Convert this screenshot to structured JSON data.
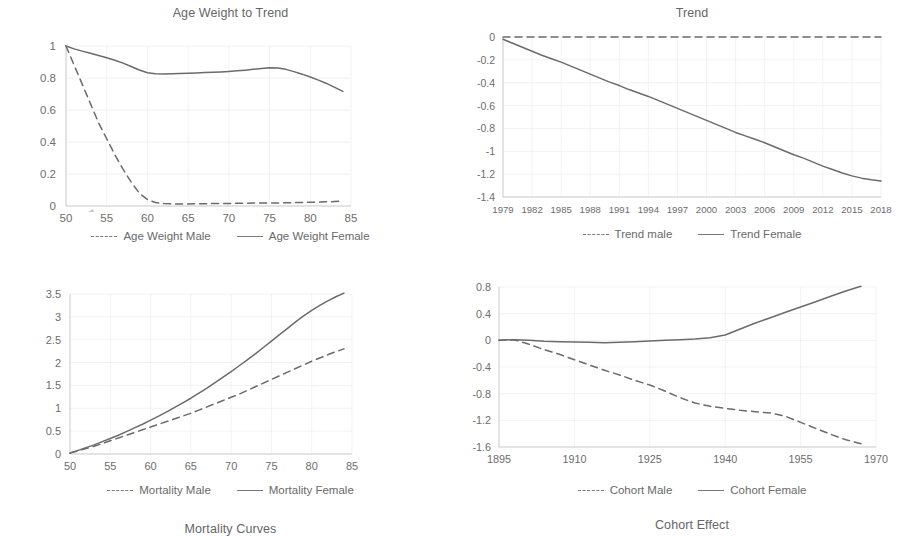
{
  "figure": {
    "background": "#ffffff",
    "line_color": "#6b6b6b",
    "grid_color": "#ededed",
    "text_color": "#6d6d6d"
  },
  "panels": [
    {
      "key": "age_weight",
      "legend": {
        "male_label": "Age Weight Male",
        "female_label": "Age Weight Female"
      }
    },
    {
      "key": "trend",
      "legend": {
        "male_label": "Trend male",
        "female_label": "Trend Female"
      }
    },
    {
      "key": "mortality",
      "legend": {
        "male_label": "Mortality Male",
        "female_label": "Mortality Female"
      }
    },
    {
      "key": "cohort",
      "legend": {
        "male_label": "Cohort Male",
        "female_label": "Cohort Female"
      }
    }
  ],
  "chart_data": [
    {
      "key": "age_weight",
      "type": "line",
      "title": "Age Weight to Trend",
      "xlabel": "",
      "ylabel": "",
      "xlim": [
        50,
        85
      ],
      "ylim": [
        0,
        1
      ],
      "xticks": [
        50,
        55,
        60,
        65,
        70,
        75,
        80,
        85
      ],
      "yticks": [
        0,
        0.2,
        0.4,
        0.6,
        0.8,
        1
      ],
      "ytick_labels": [
        "0",
        "0.2",
        "0.4",
        "0.6",
        "0.8",
        "1"
      ],
      "xtick_labels": [
        "50",
        "55",
        "60",
        "65",
        "70",
        "75",
        "80",
        "85"
      ],
      "grid": true,
      "legend_position": "bottom",
      "x": [
        50,
        51,
        52,
        53,
        54,
        55,
        56,
        57,
        58,
        59,
        60,
        61,
        62,
        63,
        64,
        65,
        66,
        67,
        68,
        69,
        70,
        71,
        72,
        73,
        74,
        75,
        76,
        77,
        78,
        79,
        80,
        81,
        82,
        83,
        84
      ],
      "series": [
        {
          "name": "Age Weight Male",
          "style": "dashed",
          "values": [
            1.0,
            0.88,
            0.76,
            0.64,
            0.52,
            0.42,
            0.32,
            0.23,
            0.15,
            0.08,
            0.04,
            0.022,
            0.015,
            0.013,
            0.013,
            0.013,
            0.014,
            0.014,
            0.015,
            0.015,
            0.016,
            0.017,
            0.017,
            0.018,
            0.018,
            0.019,
            0.019,
            0.02,
            0.021,
            0.022,
            0.023,
            0.024,
            0.026,
            0.028,
            0.03
          ]
        },
        {
          "name": "Age Weight Female",
          "style": "solid",
          "values": [
            1.0,
            0.982,
            0.968,
            0.955,
            0.941,
            0.927,
            0.911,
            0.893,
            0.872,
            0.85,
            0.833,
            0.826,
            0.825,
            0.826,
            0.828,
            0.83,
            0.832,
            0.834,
            0.836,
            0.838,
            0.841,
            0.845,
            0.849,
            0.854,
            0.859,
            0.864,
            0.862,
            0.854,
            0.84,
            0.824,
            0.806,
            0.787,
            0.766,
            0.741,
            0.716
          ]
        }
      ]
    },
    {
      "key": "trend",
      "type": "line",
      "title": "Trend",
      "xlabel": "",
      "ylabel": "",
      "xlim": [
        1979,
        2018
      ],
      "ylim": [
        -1.4,
        0
      ],
      "xticks": [
        1979,
        1982,
        1985,
        1988,
        1991,
        1994,
        1997,
        2000,
        2003,
        2006,
        2009,
        2012,
        2015,
        2018
      ],
      "yticks": [
        -1.4,
        -1.2,
        -1,
        -0.8,
        -0.6,
        -0.4,
        -0.2,
        0
      ],
      "ytick_labels": [
        "-1.4",
        "-1.2",
        "-1",
        "-0.8",
        "-0.6",
        "-0.4",
        "-0.2",
        "0"
      ],
      "xtick_labels": [
        "1979",
        "1982",
        "1985",
        "1988",
        "1991",
        "1994",
        "1997",
        "2000",
        "2003",
        "2006",
        "2009",
        "2012",
        "2015",
        "2018"
      ],
      "grid": true,
      "legend_position": "bottom",
      "x": [
        1979,
        1980,
        1981,
        1982,
        1983,
        1984,
        1985,
        1986,
        1987,
        1988,
        1989,
        1990,
        1991,
        1992,
        1993,
        1994,
        1995,
        1996,
        1997,
        1998,
        1999,
        2000,
        2001,
        2002,
        2003,
        2004,
        2005,
        2006,
        2007,
        2008,
        2009,
        2010,
        2011,
        2012,
        2013,
        2014,
        2015,
        2016,
        2017,
        2018
      ],
      "series": [
        {
          "name": "Trend male",
          "style": "dashed",
          "values": [
            0,
            0,
            0,
            0,
            0,
            0,
            0,
            0,
            0,
            0,
            0,
            0,
            0,
            0,
            0,
            0,
            0,
            0,
            0,
            0,
            0,
            0,
            0,
            0,
            0,
            0,
            0,
            0,
            0,
            0,
            0,
            0,
            0,
            0,
            0,
            0,
            0,
            0,
            0,
            0
          ]
        },
        {
          "name": "Trend Female",
          "style": "solid",
          "values": [
            -0.02,
            -0.055,
            -0.09,
            -0.125,
            -0.16,
            -0.19,
            -0.22,
            -0.255,
            -0.29,
            -0.325,
            -0.36,
            -0.395,
            -0.425,
            -0.46,
            -0.49,
            -0.52,
            -0.555,
            -0.59,
            -0.625,
            -0.66,
            -0.695,
            -0.73,
            -0.765,
            -0.8,
            -0.835,
            -0.865,
            -0.895,
            -0.925,
            -0.96,
            -0.995,
            -1.03,
            -1.06,
            -1.095,
            -1.13,
            -1.16,
            -1.19,
            -1.215,
            -1.235,
            -1.25,
            -1.26
          ]
        }
      ]
    },
    {
      "key": "mortality",
      "type": "line",
      "title": "Mortality Curves",
      "xlabel": "",
      "ylabel": "",
      "xlim": [
        50,
        85
      ],
      "ylim": [
        0,
        3.5
      ],
      "xticks": [
        50,
        55,
        60,
        65,
        70,
        75,
        80,
        85
      ],
      "yticks": [
        0,
        0.5,
        1,
        1.5,
        2,
        2.5,
        3,
        3.5
      ],
      "ytick_labels": [
        "0",
        "0.5",
        "1",
        "1.5",
        "2",
        "2.5",
        "3",
        "3.5"
      ],
      "xtick_labels": [
        "50",
        "55",
        "60",
        "65",
        "70",
        "75",
        "80",
        "85"
      ],
      "grid": true,
      "legend_position": "bottom",
      "x": [
        50,
        51,
        52,
        53,
        54,
        55,
        56,
        57,
        58,
        59,
        60,
        61,
        62,
        63,
        64,
        65,
        66,
        67,
        68,
        69,
        70,
        71,
        72,
        73,
        74,
        75,
        76,
        77,
        78,
        79,
        80,
        81,
        82,
        83,
        84
      ],
      "series": [
        {
          "name": "Mortality Male",
          "style": "dashed",
          "values": [
            0.02,
            0.07,
            0.12,
            0.17,
            0.23,
            0.29,
            0.35,
            0.41,
            0.47,
            0.53,
            0.59,
            0.65,
            0.71,
            0.77,
            0.83,
            0.89,
            0.96,
            1.03,
            1.1,
            1.17,
            1.24,
            1.31,
            1.39,
            1.47,
            1.55,
            1.63,
            1.71,
            1.79,
            1.87,
            1.95,
            2.03,
            2.1,
            2.17,
            2.24,
            2.3
          ]
        },
        {
          "name": "Mortality Female",
          "style": "solid",
          "values": [
            0.02,
            0.08,
            0.14,
            0.2,
            0.27,
            0.34,
            0.41,
            0.49,
            0.57,
            0.65,
            0.74,
            0.83,
            0.92,
            1.02,
            1.12,
            1.22,
            1.33,
            1.44,
            1.56,
            1.68,
            1.8,
            1.93,
            2.06,
            2.19,
            2.33,
            2.47,
            2.61,
            2.75,
            2.89,
            3.02,
            3.14,
            3.25,
            3.35,
            3.44,
            3.52
          ]
        }
      ]
    },
    {
      "key": "cohort",
      "type": "line",
      "title": "Cohort Effect",
      "xlabel": "",
      "ylabel": "",
      "xlim": [
        1895,
        1970
      ],
      "ylim": [
        -1.6,
        0.8
      ],
      "xticks": [
        1895,
        1910,
        1925,
        1940,
        1955,
        1970
      ],
      "yticks": [
        -1.6,
        -1.2,
        -0.8,
        -0.4,
        0,
        0.4,
        0.8
      ],
      "ytick_labels": [
        "-1.6",
        "-1.2",
        "-0.8",
        "-0.4",
        "0",
        "0.4",
        "0.8"
      ],
      "xtick_labels": [
        "1895",
        "1910",
        "1925",
        "1940",
        "1955",
        "1970"
      ],
      "grid": true,
      "legend_position": "bottom",
      "x": [
        1895,
        1898,
        1901,
        1904,
        1907,
        1910,
        1913,
        1916,
        1919,
        1922,
        1925,
        1928,
        1931,
        1934,
        1937,
        1940,
        1943,
        1946,
        1949,
        1952,
        1955,
        1958,
        1961,
        1964,
        1967
      ],
      "series": [
        {
          "name": "Cohort Male",
          "style": "dashed",
          "values": [
            0.0,
            0.01,
            -0.06,
            -0.14,
            -0.21,
            -0.29,
            -0.37,
            -0.45,
            -0.52,
            -0.6,
            -0.67,
            -0.76,
            -0.86,
            -0.94,
            -0.99,
            -1.02,
            -1.05,
            -1.07,
            -1.09,
            -1.14,
            -1.23,
            -1.32,
            -1.41,
            -1.49,
            -1.55
          ]
        },
        {
          "name": "Cohort Female",
          "style": "solid",
          "values": [
            0.0,
            0.01,
            0.0,
            -0.015,
            -0.02,
            -0.025,
            -0.03,
            -0.035,
            -0.03,
            -0.02,
            -0.01,
            0.0,
            0.01,
            0.02,
            0.04,
            0.08,
            0.17,
            0.26,
            0.34,
            0.42,
            0.5,
            0.58,
            0.66,
            0.74,
            0.81
          ]
        }
      ]
    }
  ]
}
